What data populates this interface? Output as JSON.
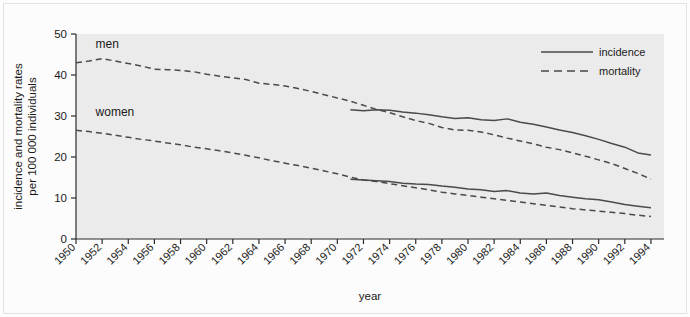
{
  "figure": {
    "background_color": "#fdfdfd",
    "plot_area_color": "#ebebeb",
    "line_color": "#4a4a4a",
    "axis_color": "#2b2b2b"
  },
  "axes": {
    "y_title_line1": "incidence and mortality rates",
    "y_title_line2": "per 100 000 individuals",
    "x_title": "year",
    "y_ticks": [
      "0",
      "10",
      "20",
      "30",
      "40",
      "50"
    ],
    "x_ticks": [
      "1950",
      "1952",
      "1954",
      "1956",
      "1958",
      "1960",
      "1962",
      "1964",
      "1966",
      "1968",
      "1970",
      "1972",
      "1974",
      "1976",
      "1978",
      "1980",
      "1982",
      "1984",
      "1986",
      "1988",
      "1990",
      "1992",
      "1994"
    ]
  },
  "legend": {
    "position": "top-right",
    "items": [
      {
        "label": "incidence",
        "style": "solid"
      },
      {
        "label": "mortality",
        "style": "dashed"
      }
    ]
  },
  "annotations": [
    {
      "text": "men",
      "x_year": 1951.5,
      "y_value": 46.5
    },
    {
      "text": "women",
      "x_year": 1951.5,
      "y_value": 30.0
    }
  ],
  "chart_data": {
    "type": "line",
    "title": "",
    "xlabel": "year",
    "ylabel": "incidence and mortality rates per 100 000 individuals",
    "xlim": [
      1950,
      1995
    ],
    "ylim": [
      0,
      50
    ],
    "grid": false,
    "legend": [
      "incidence",
      "mortality"
    ],
    "x": [
      1950,
      1951,
      1952,
      1953,
      1954,
      1955,
      1956,
      1957,
      1958,
      1959,
      1960,
      1961,
      1962,
      1963,
      1964,
      1965,
      1966,
      1967,
      1968,
      1969,
      1970,
      1971,
      1972,
      1973,
      1974,
      1975,
      1976,
      1977,
      1978,
      1979,
      1980,
      1981,
      1982,
      1983,
      1984,
      1985,
      1986,
      1987,
      1988,
      1989,
      1990,
      1991,
      1992,
      1993,
      1994
    ],
    "series": [
      {
        "name": "men mortality",
        "group": "men",
        "measure": "mortality",
        "style": "dashed",
        "x": [
          1950,
          1951,
          1952,
          1953,
          1954,
          1955,
          1956,
          1957,
          1958,
          1959,
          1960,
          1961,
          1962,
          1963,
          1964,
          1965,
          1966,
          1967,
          1968,
          1969,
          1970,
          1971,
          1972,
          1973,
          1974,
          1975,
          1976,
          1977,
          1978,
          1979,
          1980,
          1981,
          1982,
          1983,
          1984,
          1985,
          1986,
          1987,
          1988,
          1989,
          1990,
          1991,
          1992,
          1993,
          1994
        ],
        "values": [
          43.0,
          43.4,
          44.0,
          43.4,
          42.8,
          42.2,
          41.4,
          41.3,
          41.1,
          40.8,
          40.2,
          39.7,
          39.3,
          38.9,
          38.0,
          37.7,
          37.3,
          36.7,
          36.0,
          35.2,
          34.4,
          33.6,
          32.6,
          31.6,
          30.8,
          29.8,
          28.9,
          28.2,
          27.2,
          26.6,
          26.5,
          26.1,
          25.4,
          24.6,
          23.9,
          23.2,
          22.4,
          21.8,
          21.0,
          20.2,
          19.3,
          18.4,
          17.2,
          16.0,
          14.6
        ]
      },
      {
        "name": "men incidence",
        "group": "men",
        "measure": "incidence",
        "style": "solid",
        "x": [
          1971,
          1972,
          1973,
          1974,
          1975,
          1976,
          1977,
          1978,
          1979,
          1980,
          1981,
          1982,
          1983,
          1984,
          1985,
          1986,
          1987,
          1988,
          1989,
          1990,
          1991,
          1992,
          1993,
          1994
        ],
        "values": [
          31.5,
          31.3,
          31.5,
          31.4,
          31.0,
          30.7,
          30.3,
          29.8,
          29.4,
          29.6,
          29.1,
          28.9,
          29.3,
          28.5,
          28.0,
          27.3,
          26.6,
          26.0,
          25.2,
          24.3,
          23.3,
          22.4,
          21.0,
          20.5
        ]
      },
      {
        "name": "women mortality",
        "group": "women",
        "measure": "mortality",
        "style": "dashed",
        "x": [
          1950,
          1951,
          1952,
          1953,
          1954,
          1955,
          1956,
          1957,
          1958,
          1959,
          1960,
          1961,
          1962,
          1963,
          1964,
          1965,
          1966,
          1967,
          1968,
          1969,
          1970,
          1971,
          1972,
          1973,
          1974,
          1975,
          1976,
          1977,
          1978,
          1979,
          1980,
          1981,
          1982,
          1983,
          1984,
          1985,
          1986,
          1987,
          1988,
          1989,
          1990,
          1991,
          1992,
          1993,
          1994
        ],
        "values": [
          26.5,
          26.2,
          25.8,
          25.3,
          24.8,
          24.3,
          23.9,
          23.4,
          23.0,
          22.4,
          22.0,
          21.5,
          21.0,
          20.4,
          19.8,
          19.1,
          18.5,
          17.9,
          17.3,
          16.6,
          15.9,
          15.1,
          14.4,
          14.0,
          13.5,
          13.0,
          12.5,
          12.0,
          11.4,
          11.0,
          10.6,
          10.2,
          9.8,
          9.4,
          9.0,
          8.6,
          8.2,
          7.8,
          7.4,
          7.1,
          6.8,
          6.5,
          6.2,
          5.8,
          5.5
        ]
      },
      {
        "name": "women incidence",
        "group": "women",
        "measure": "incidence",
        "style": "solid",
        "x": [
          1971,
          1972,
          1973,
          1974,
          1975,
          1976,
          1977,
          1978,
          1979,
          1980,
          1981,
          1982,
          1983,
          1984,
          1985,
          1986,
          1987,
          1988,
          1989,
          1990,
          1991,
          1992,
          1993,
          1994
        ],
        "values": [
          14.6,
          14.4,
          14.2,
          14.0,
          13.6,
          13.4,
          13.3,
          12.9,
          12.6,
          12.2,
          12.0,
          11.6,
          11.8,
          11.2,
          11.0,
          11.2,
          10.6,
          10.2,
          9.8,
          9.6,
          9.0,
          8.4,
          8.0,
          7.6
        ]
      }
    ]
  }
}
